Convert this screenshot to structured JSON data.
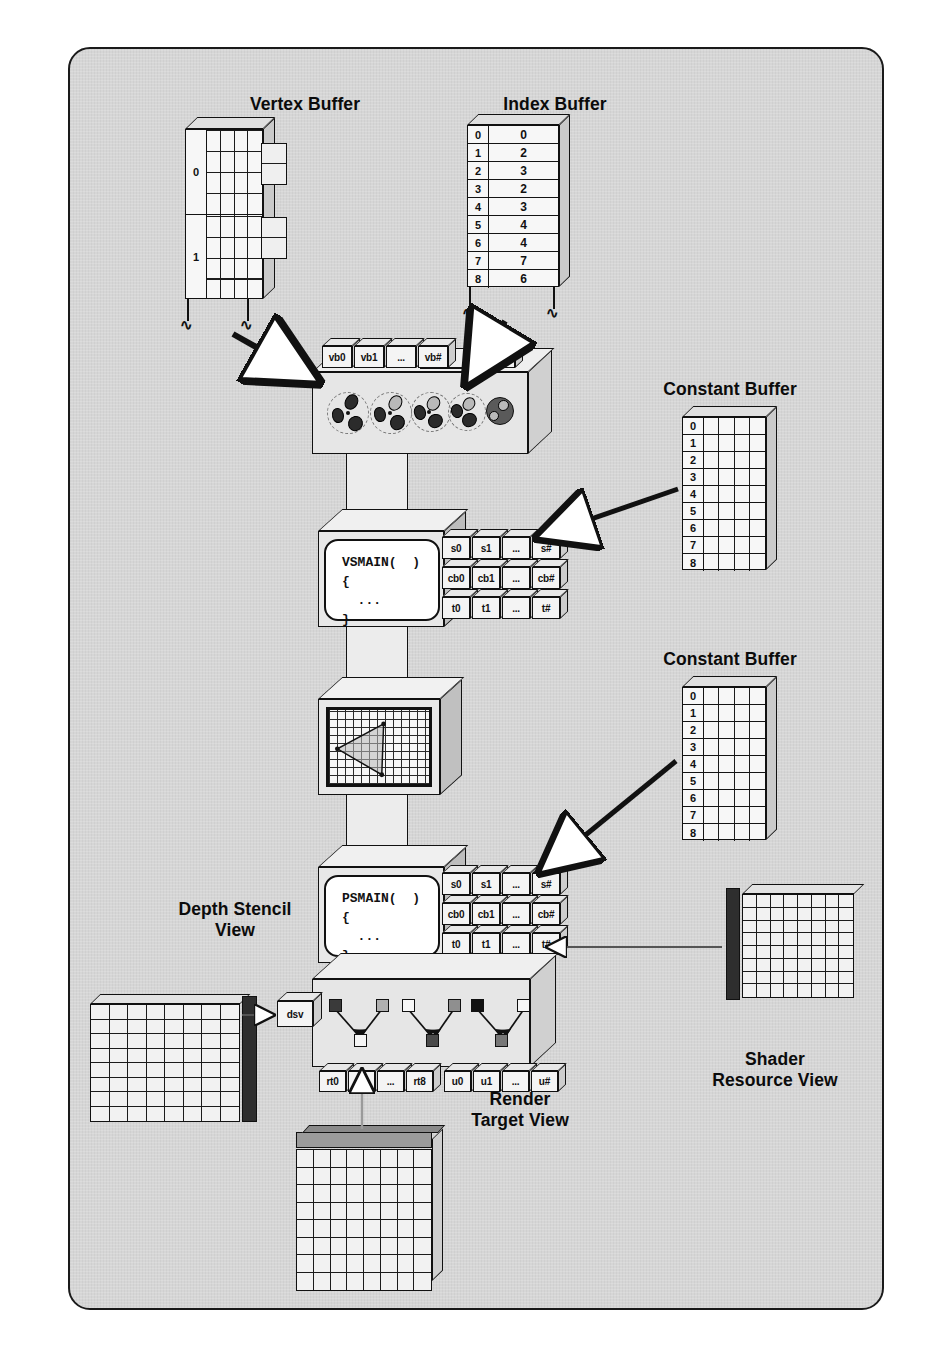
{
  "figure": {
    "title_alt": "Direct3D 11 pipeline resource binding diagram",
    "background": "#d6d6d6",
    "border_color": "#1a1a1a"
  },
  "labels": {
    "vertex_buffer": "Vertex Buffer",
    "index_buffer": "Index Buffer",
    "constant_buffer_vs": "Constant Buffer",
    "constant_buffer_ps": "Constant Buffer",
    "depth_stencil_view": "Depth Stencil\nView",
    "shader_resource_view": "Shader\nResource View",
    "render_target_view": "Render\nTarget View"
  },
  "vertex_buffer": {
    "row_labels": [
      "0",
      "1"
    ],
    "columns": 4,
    "rows_per_group": 4
  },
  "index_buffer": {
    "indices": [
      "0",
      "1",
      "2",
      "3",
      "4",
      "5",
      "6",
      "7",
      "8"
    ],
    "values": [
      "0",
      "2",
      "3",
      "2",
      "3",
      "4",
      "4",
      "7",
      "6"
    ]
  },
  "constant_buffer": {
    "indices": [
      "0",
      "1",
      "2",
      "3",
      "4",
      "5",
      "6",
      "7",
      "8"
    ],
    "columns": 4
  },
  "input_assembler": {
    "vertex_slots": [
      "vb0",
      "vb1",
      "...",
      "vb#"
    ],
    "index_slots": [
      "ib0"
    ],
    "icon_names": [
      "primitive-icon-1",
      "primitive-icon-2",
      "primitive-icon-3",
      "primitive-icon-4",
      "primitive-icon-5"
    ]
  },
  "vertex_shader": {
    "code": "VSMAIN(  )\n{\n  ...\n}",
    "slots": {
      "samplers": [
        "s0",
        "s1",
        "...",
        "s#"
      ],
      "constant_buffers": [
        "cb0",
        "cb1",
        "...",
        "cb#"
      ],
      "textures": [
        "t0",
        "t1",
        "...",
        "t#"
      ]
    }
  },
  "rasterizer": {
    "grid_cols": 10,
    "grid_rows": 10,
    "triangle": [
      [
        55,
        14
      ],
      [
        6,
        48
      ],
      [
        51,
        75
      ]
    ]
  },
  "pixel_shader": {
    "code": "PSMAIN(  )\n{\n  ...\n}",
    "slots": {
      "samplers": [
        "s0",
        "s1",
        "...",
        "s#"
      ],
      "constant_buffers": [
        "cb0",
        "cb1",
        "...",
        "cb#"
      ],
      "textures": [
        "t0",
        "t1",
        "...",
        "t#"
      ]
    }
  },
  "output_merger": {
    "dsv_label": "dsv",
    "render_target_slots": [
      "rt0",
      "rt1",
      "...",
      "rt8"
    ],
    "uav_slots": [
      "u0",
      "u1",
      "...",
      "u#"
    ],
    "blend_groups": [
      {
        "inputs": [
          "#3a3a3a",
          "#b0b0b0"
        ],
        "output": "#f5f5f5"
      },
      {
        "inputs": [
          "#f7f7f7",
          "#8f8f8f"
        ],
        "output": "#4a4a4a"
      },
      {
        "inputs": [
          "#111111",
          "#f7f7f7"
        ],
        "output": "#777777"
      }
    ]
  },
  "views": {
    "depth_stencil": {
      "cols": 8,
      "rows": 8,
      "bar_side": "right",
      "bar_color": "#2e2e2e"
    },
    "shader_resource": {
      "cols": 8,
      "rows": 8,
      "bar_side": "left",
      "bar_color": "#2e2e2e"
    },
    "render_target": {
      "cols": 8,
      "rows": 8,
      "bar_side": "top",
      "bar_color": "#9b9b9b"
    }
  },
  "colors": {
    "ink": "#111111",
    "panel": "#e8e8e8",
    "face": "#f2f2f2",
    "shadow": "#c8c8c8"
  }
}
